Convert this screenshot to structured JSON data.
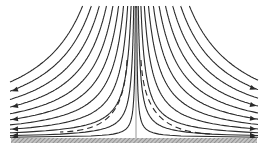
{
  "diagram": {
    "type": "stagnation-point-flow",
    "colors": {
      "line": "#2a2a2a",
      "axis": "#8a8a8a",
      "wall_fill": "#bdbdbd",
      "wall_hatch": "#6e6e6e",
      "background": "#ffffff"
    },
    "center_x": 136,
    "wall_y": 138,
    "wall": {
      "x1": 11,
      "x2": 257,
      "thickness": 5
    },
    "symmetry_line": {
      "y_top": 8,
      "y_bottom": 138
    },
    "streamline_constants": [
      90,
      300,
      650,
      1100,
      1650,
      2300,
      3050,
      3900,
      4850,
      5900,
      7050
    ],
    "streamline_count_per_side": 11,
    "clip": {
      "x_min": 10,
      "x_max": 258,
      "y_min": 6
    },
    "arrow_direction": {
      "left": "outward-left",
      "right": "outward-right"
    },
    "boundary_layer": {
      "style": "dashed",
      "left": {
        "start": [
          127,
          60
        ],
        "ctrl1": [
          124,
          110
        ],
        "ctrl2": [
          110,
          131
        ],
        "end": [
          60,
          132
        ]
      },
      "right": {
        "start": [
          141,
          60
        ],
        "ctrl1": [
          144,
          110
        ],
        "ctrl2": [
          160,
          131
        ],
        "end": [
          210,
          134
        ]
      }
    }
  }
}
